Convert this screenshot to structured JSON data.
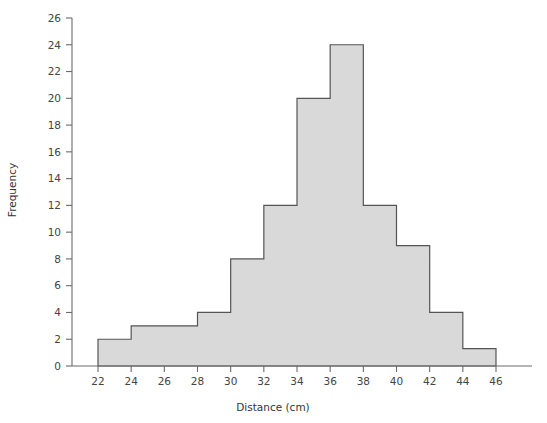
{
  "chart_data": {
    "type": "bar",
    "title": "",
    "subtitle": "",
    "xlabel": "Distance (cm)",
    "ylabel": "Frequency",
    "xlim": [
      21,
      47
    ],
    "ylim": [
      0,
      26
    ],
    "grid": false,
    "legend": null,
    "bin_width": 2,
    "bin_edges": [
      22,
      24,
      26,
      28,
      30,
      32,
      34,
      36,
      38,
      40,
      42,
      44,
      46
    ],
    "categories": [
      "22-24",
      "24-26",
      "26-28",
      "28-30",
      "30-32",
      "32-34",
      "34-36",
      "36-38",
      "38-40",
      "40-42",
      "42-44",
      "44-46"
    ],
    "values": [
      2,
      3,
      3,
      4,
      8,
      12,
      20,
      24,
      12,
      9,
      4,
      1.3
    ],
    "xticks": [
      22,
      24,
      26,
      28,
      30,
      32,
      34,
      36,
      38,
      40,
      42,
      44,
      46
    ],
    "xtick_labels": [
      "22",
      "24",
      "26",
      "28",
      "30",
      "32",
      "34",
      "36",
      "38",
      "40",
      "42",
      "44",
      "46"
    ],
    "yticks": [
      0,
      2,
      4,
      6,
      8,
      10,
      12,
      14,
      16,
      18,
      20,
      22,
      24,
      26
    ],
    "ytick_labels": [
      "0",
      "2",
      "4",
      "6",
      "8",
      "10",
      "12",
      "14",
      "16",
      "18",
      "20",
      "22",
      "24",
      "26"
    ],
    "colors": {
      "bar_fill": "#d9d9d9",
      "bar_stroke": "#555555",
      "axis": "#6b6b6b",
      "text": "#3a3a3a",
      "background": "#ffffff"
    }
  }
}
